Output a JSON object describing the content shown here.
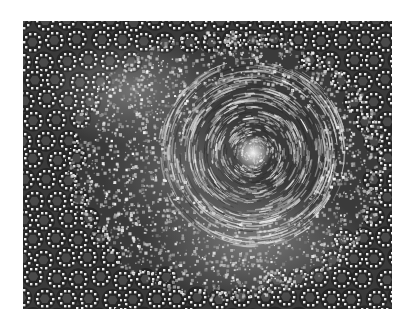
{
  "image": {
    "description": "Grayscale abstract artwork: a swirling vortex of streaked particles right of center, surrounded by diffuse bright particle clouds, transitioning to a quasi-periodic lattice of white dots forming rings around dark grey pentagon/hexagon tiles near the edges.",
    "canvas": {
      "width": 413,
      "height": 322,
      "background": "#ffffff"
    },
    "frame": {
      "x": 23,
      "y": 21,
      "width": 369,
      "height": 288
    },
    "palette": {
      "base": "#3a3a3a",
      "dark_tile": "#4a4a4a",
      "edge_dark": "#262626",
      "dot": "#e6e6e6",
      "glow": "#f4f4f4"
    },
    "spiral": {
      "cx": 230,
      "cy": 132,
      "radius": 95,
      "arms": 3,
      "core_glow_radius": 18
    },
    "clouds": [
      {
        "cx": 110,
        "cy": 70,
        "rx": 90,
        "ry": 55,
        "intensity": 0.35
      },
      {
        "cx": 230,
        "cy": 220,
        "rx": 110,
        "ry": 60,
        "intensity": 0.4
      },
      {
        "cx": 160,
        "cy": 150,
        "rx": 80,
        "ry": 70,
        "intensity": 0.25
      }
    ],
    "lattice": {
      "tile_spacing": 22,
      "dots_per_ring": 10,
      "ring_radius": 8
    }
  }
}
